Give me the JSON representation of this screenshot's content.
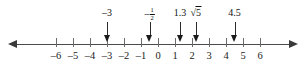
{
  "figure": {
    "type": "number-line"
  },
  "number_line": {
    "min": -6,
    "max": 6,
    "step": 1,
    "zero_x": 158,
    "pixels_per_unit": 17,
    "line_y": 45,
    "left_arrow": "left-arrowhead",
    "right_arrow": "right-arrowhead",
    "ticks": [
      {
        "value": -6,
        "label": "–6"
      },
      {
        "value": -5,
        "label": "–5"
      },
      {
        "value": -4,
        "label": "–4"
      },
      {
        "value": -3,
        "label": "–3"
      },
      {
        "value": -2,
        "label": "–2"
      },
      {
        "value": -1,
        "label": "–1"
      },
      {
        "value": 0,
        "label": "0"
      },
      {
        "value": 1,
        "label": "1"
      },
      {
        "value": 2,
        "label": "2"
      },
      {
        "value": 3,
        "label": "3"
      },
      {
        "value": 4,
        "label": "4"
      },
      {
        "value": 5,
        "label": "5"
      },
      {
        "value": 6,
        "label": "6"
      }
    ]
  },
  "markers": [
    {
      "id": "marker-neg-3",
      "value": -3,
      "label": "–3",
      "kind": "plain"
    },
    {
      "id": "marker-neg-one-half",
      "value": -0.5,
      "label": "–",
      "kind": "fraction",
      "numerator": "1",
      "denominator": "2"
    },
    {
      "id": "marker-1-3",
      "value": 1.3,
      "label": "1.3",
      "kind": "plain"
    },
    {
      "id": "marker-sqrt-5",
      "value": 2.24,
      "label": "5",
      "kind": "radical"
    },
    {
      "id": "marker-4-5",
      "value": 4.5,
      "label": "4.5",
      "kind": "plain"
    }
  ],
  "colors": {
    "line": "#4a4a4a",
    "tick": "#6a6a6a",
    "text": "#111111",
    "arrow": "#1a1a1a",
    "background": "#ffffff"
  }
}
